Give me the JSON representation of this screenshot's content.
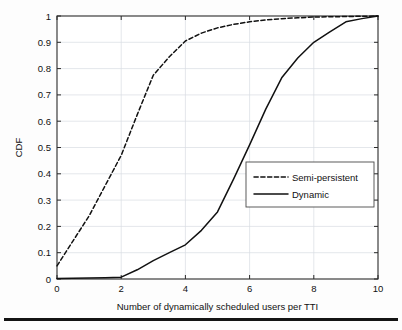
{
  "figure": {
    "background_color": "#fdfdfd",
    "line_color": "#111111",
    "grid_color": "#d9dde2",
    "axis_color": "#2b2b2b"
  },
  "axes": {
    "x_title": "Number of dynamically scheduled users per TTI",
    "y_title": "CDF",
    "x_ticks": [
      "0",
      "2",
      "4",
      "6",
      "8",
      "10"
    ],
    "y_ticks": [
      "0",
      "0.1",
      "0.2",
      "0.3",
      "0.4",
      "0.5",
      "0.6",
      "0.7",
      "0.8",
      "0.9",
      "1"
    ]
  },
  "legend": {
    "entries": [
      {
        "label": "Semi-persistent",
        "style": "dashed"
      },
      {
        "label": "Dynamic",
        "style": "solid"
      }
    ]
  },
  "chart_data": {
    "type": "line",
    "title": "",
    "xlabel": "Number of dynamically scheduled users per TTI",
    "ylabel": "CDF",
    "xlim": [
      0,
      10
    ],
    "ylim": [
      0,
      1
    ],
    "xticks": [
      0,
      2,
      4,
      6,
      8,
      10
    ],
    "yticks": [
      0,
      0.1,
      0.2,
      0.3,
      0.4,
      0.5,
      0.6,
      0.7,
      0.8,
      0.9,
      1
    ],
    "grid": true,
    "legend_position": "center-right",
    "series": [
      {
        "name": "Semi-persistent",
        "style": "dashed",
        "x": [
          0,
          0.5,
          1,
          1.5,
          2,
          2.5,
          3,
          3.5,
          4,
          4.5,
          5,
          5.5,
          6,
          6.5,
          7,
          7.5,
          8,
          8.5,
          9,
          9.5,
          10
        ],
        "values": [
          0.05,
          0.145,
          0.24,
          0.355,
          0.47,
          0.625,
          0.775,
          0.845,
          0.905,
          0.935,
          0.955,
          0.968,
          0.978,
          0.985,
          0.99,
          0.993,
          0.996,
          0.997,
          0.998,
          0.999,
          1.0
        ]
      },
      {
        "name": "Dynamic",
        "style": "solid",
        "x": [
          0,
          0.5,
          1,
          1.5,
          2,
          2.5,
          3,
          3.5,
          4,
          4.5,
          5,
          5.5,
          6,
          6.5,
          7,
          7.5,
          8,
          8.5,
          9,
          9.5,
          10
        ],
        "values": [
          0.002,
          0.003,
          0.004,
          0.005,
          0.007,
          0.035,
          0.07,
          0.1,
          0.13,
          0.185,
          0.255,
          0.38,
          0.51,
          0.645,
          0.765,
          0.84,
          0.9,
          0.94,
          0.978,
          0.99,
          1.0
        ]
      }
    ]
  }
}
